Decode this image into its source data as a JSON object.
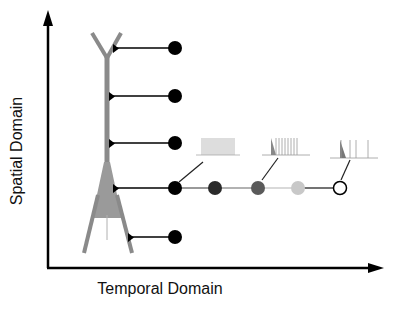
{
  "axes": {
    "y_label": "Spatial Domain",
    "x_label": "Temporal Domain"
  },
  "neuron": {
    "color": "#8a8a8a",
    "soma_fill": "#9a9a9a"
  },
  "spatial_probes": [
    {
      "y": 48,
      "x_start": 115
    },
    {
      "y": 96,
      "x_start": 110
    },
    {
      "y": 143,
      "x_start": 110
    },
    {
      "y": 188,
      "x_start": 114
    },
    {
      "y": 237,
      "x_start": 130
    }
  ],
  "temporal_points": [
    {
      "x": 175,
      "color": "#000000"
    },
    {
      "x": 215,
      "color": "#2a2a2a"
    },
    {
      "x": 258,
      "color": "#5a5a5a"
    },
    {
      "x": 298,
      "color": "#c8c8c8"
    },
    {
      "x": 340,
      "color": "#ffffff"
    }
  ],
  "spike_traces": [
    {
      "label": "dense-train"
    },
    {
      "label": "medium-train"
    },
    {
      "label": "sparse-train"
    }
  ]
}
